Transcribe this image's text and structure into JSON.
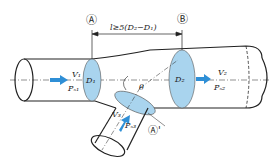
{
  "diagram": {
    "section_labels": {
      "a": "Ⓐ",
      "b": "Ⓑ",
      "a_prime": "Ⓐ'"
    },
    "distance_label": "l≥5(D₂−D₁)",
    "main_inlet": {
      "velocity": "V₁",
      "pressure": "Pₛ₁",
      "diameter": "D₁"
    },
    "main_outlet": {
      "velocity": "V₂",
      "pressure": "Pₛ₂",
      "diameter": "D₂"
    },
    "branch_inlet": {
      "velocity": "V₃",
      "pressure": "Pₛ₃"
    },
    "angle_label": "θ",
    "colors": {
      "fill_section": "#a9d4ee",
      "arrow": "#2f8fd6",
      "stroke": "#222222"
    }
  }
}
